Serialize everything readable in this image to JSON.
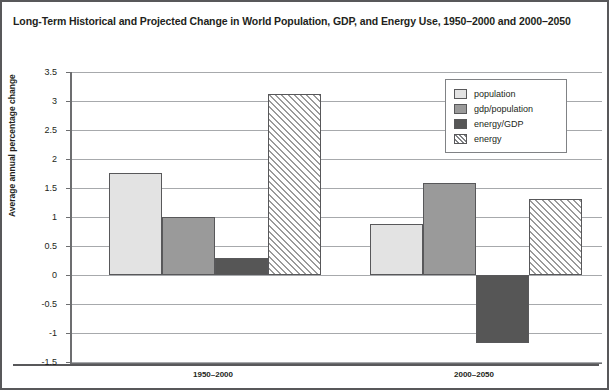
{
  "chart_data": {
    "type": "bar",
    "title": "Long-Term Historical and Projected Change in World Population, GDP, and Energy Use, 1950–2000 and 2000–2050",
    "xlabel": "",
    "ylabel": "Average annual percentage change",
    "categories": [
      "1950–2000",
      "2000–2050"
    ],
    "ylim": [
      -1.5,
      3.5
    ],
    "ytick_labels": [
      "3.5",
      "3",
      "2.5",
      "2",
      "1.5",
      "1",
      "0.5",
      "0",
      "-0.5",
      "-1",
      "-1.5"
    ],
    "ytick_values": [
      3.5,
      3,
      2.5,
      2,
      1.5,
      1,
      0.5,
      0,
      -0.5,
      -1,
      -1.5
    ],
    "grid": true,
    "legend_position": "upper right",
    "series": [
      {
        "name": "population",
        "values": [
          1.76,
          0.88
        ],
        "color": "#e3e3e3",
        "pattern": "solid"
      },
      {
        "name": "gdp/population",
        "values": [
          1.0,
          1.58
        ],
        "color": "#9a9a9a",
        "pattern": "solid"
      },
      {
        "name": "energy/GDP",
        "values": [
          0.29,
          -1.17
        ],
        "color": "#565656",
        "pattern": "solid"
      },
      {
        "name": "energy",
        "values": [
          3.12,
          1.31
        ],
        "color": "#ffffff",
        "pattern": "diagonal-hatch"
      }
    ]
  },
  "colors": {
    "population": "#e3e3e3",
    "gdp_population": "#9a9a9a",
    "energy_gdp": "#565656",
    "energy_hatch": "#9a9a9a",
    "axis": "#6d6e70",
    "grid": "#a7a9ac",
    "text": "#231f20",
    "frame": "#58585a"
  }
}
